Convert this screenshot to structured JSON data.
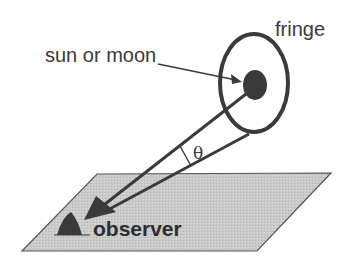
{
  "diagram": {
    "labels": {
      "source": "sun or moon",
      "ring": "fringe",
      "angle": "θ",
      "observer": "observer"
    },
    "colors": {
      "stroke": "#3a3a3a",
      "plane_fill": "#c8c8c8",
      "plane_stroke": "#555555",
      "background": "#ffffff"
    },
    "elements": [
      "ground-plane",
      "halo-ring",
      "sun-or-moon-disc",
      "ray-to-center",
      "ray-to-fringe",
      "angle-arc",
      "observer-marker",
      "pointer-arrow"
    ]
  }
}
